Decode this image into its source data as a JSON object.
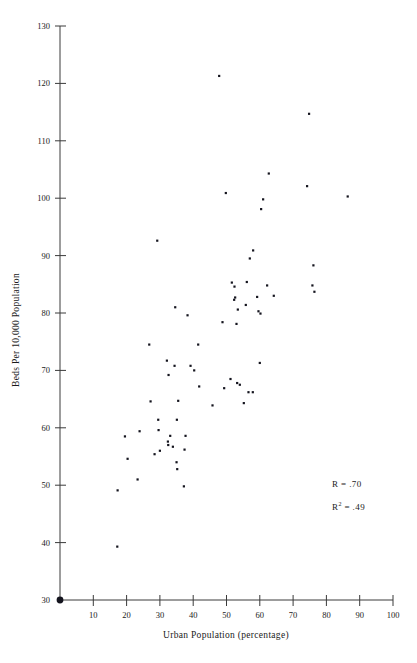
{
  "chart_data": {
    "type": "scatter",
    "title": "",
    "xlabel": "Urban Population (percentage)",
    "ylabel": "Beds Per 10,000 Population",
    "xlim": [
      0,
      100
    ],
    "ylim": [
      30,
      130
    ],
    "xticks": [
      10,
      20,
      30,
      40,
      50,
      60,
      70,
      80,
      90,
      100
    ],
    "yticks": [
      30,
      40,
      50,
      60,
      70,
      80,
      90,
      100,
      110,
      120,
      130
    ],
    "grid": false,
    "legend": null,
    "annotations": [
      {
        "name": "correlation",
        "text": "R = .70",
        "x": 84,
        "y": 54.5
      },
      {
        "name": "r-squared",
        "text": "R",
        "sup": "2",
        "rest": " = .49",
        "x": 84,
        "y": 49.5
      }
    ],
    "marker": {
      "shape": "square",
      "color": "#14141e",
      "size": 2.2
    },
    "origin_marker": {
      "shape": "circle",
      "color": "#14141e",
      "size": 4
    },
    "points": [
      {
        "x": 17.2,
        "y": 39.3
      },
      {
        "x": 17.3,
        "y": 49.1
      },
      {
        "x": 19.5,
        "y": 58.5
      },
      {
        "x": 20.3,
        "y": 54.6
      },
      {
        "x": 23.3,
        "y": 51.0
      },
      {
        "x": 23.9,
        "y": 59.4
      },
      {
        "x": 26.8,
        "y": 74.5
      },
      {
        "x": 27.2,
        "y": 64.6
      },
      {
        "x": 28.4,
        "y": 55.4
      },
      {
        "x": 29.2,
        "y": 92.6
      },
      {
        "x": 29.5,
        "y": 61.4
      },
      {
        "x": 29.6,
        "y": 59.6
      },
      {
        "x": 30.0,
        "y": 56.0
      },
      {
        "x": 32.1,
        "y": 71.7
      },
      {
        "x": 32.4,
        "y": 57.6
      },
      {
        "x": 32.5,
        "y": 57.0
      },
      {
        "x": 32.6,
        "y": 69.2
      },
      {
        "x": 33.1,
        "y": 58.6
      },
      {
        "x": 33.9,
        "y": 56.7
      },
      {
        "x": 34.4,
        "y": 70.8
      },
      {
        "x": 34.6,
        "y": 81.0
      },
      {
        "x": 35.0,
        "y": 54.0
      },
      {
        "x": 35.1,
        "y": 61.4
      },
      {
        "x": 35.2,
        "y": 52.8
      },
      {
        "x": 35.5,
        "y": 64.7
      },
      {
        "x": 37.2,
        "y": 49.8
      },
      {
        "x": 37.4,
        "y": 56.2
      },
      {
        "x": 37.7,
        "y": 58.6
      },
      {
        "x": 38.3,
        "y": 79.6
      },
      {
        "x": 39.2,
        "y": 70.8
      },
      {
        "x": 40.3,
        "y": 70.0
      },
      {
        "x": 41.5,
        "y": 74.5
      },
      {
        "x": 41.8,
        "y": 67.2
      },
      {
        "x": 45.8,
        "y": 63.9
      },
      {
        "x": 47.8,
        "y": 121.3
      },
      {
        "x": 48.8,
        "y": 78.4
      },
      {
        "x": 49.3,
        "y": 66.9
      },
      {
        "x": 49.8,
        "y": 100.9
      },
      {
        "x": 51.2,
        "y": 68.5
      },
      {
        "x": 51.6,
        "y": 85.3
      },
      {
        "x": 52.3,
        "y": 82.3
      },
      {
        "x": 52.4,
        "y": 84.6
      },
      {
        "x": 52.6,
        "y": 82.7
      },
      {
        "x": 53.0,
        "y": 78.1
      },
      {
        "x": 53.2,
        "y": 67.8
      },
      {
        "x": 53.4,
        "y": 80.6
      },
      {
        "x": 54.0,
        "y": 67.5
      },
      {
        "x": 55.2,
        "y": 64.3
      },
      {
        "x": 55.8,
        "y": 81.4
      },
      {
        "x": 56.1,
        "y": 85.4
      },
      {
        "x": 56.6,
        "y": 66.2
      },
      {
        "x": 57.0,
        "y": 89.5
      },
      {
        "x": 57.9,
        "y": 66.2
      },
      {
        "x": 58.0,
        "y": 90.9
      },
      {
        "x": 59.2,
        "y": 82.8
      },
      {
        "x": 59.6,
        "y": 80.3
      },
      {
        "x": 60.0,
        "y": 71.3
      },
      {
        "x": 60.2,
        "y": 79.9
      },
      {
        "x": 60.4,
        "y": 98.1
      },
      {
        "x": 61.0,
        "y": 99.8
      },
      {
        "x": 62.2,
        "y": 84.8
      },
      {
        "x": 62.7,
        "y": 104.3
      },
      {
        "x": 64.2,
        "y": 83.0
      },
      {
        "x": 74.2,
        "y": 102.1
      },
      {
        "x": 74.8,
        "y": 114.7
      },
      {
        "x": 75.8,
        "y": 84.8
      },
      {
        "x": 76.1,
        "y": 88.3
      },
      {
        "x": 76.4,
        "y": 83.7
      },
      {
        "x": 86.4,
        "y": 100.3
      }
    ]
  }
}
